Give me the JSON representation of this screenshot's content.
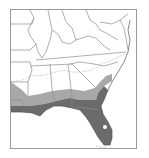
{
  "map": {
    "region": "Southeastern United States",
    "colors": {
      "background": "#ffffff",
      "frame": "#9a9a9a",
      "state_border": "#8c8c8c",
      "range_dark": "#6b6b6b",
      "range_light": "#a8a8a8",
      "dotted_line": "#8c8c8c"
    },
    "legend_items": []
  }
}
